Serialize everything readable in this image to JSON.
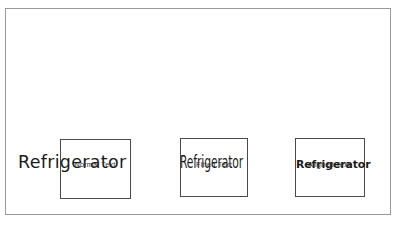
{
  "figure": {
    "background_color": "#ffffff",
    "frame_color": "#9a9a9a",
    "box_border_color": "#4a4a4a",
    "text_color": "#1b1b1b"
  },
  "samples": [
    {
      "id": "normal",
      "text": "Refrigerator",
      "caption": "Normal Text",
      "behavior": "text drawn at natural size, overflowing both edges of the box"
    },
    {
      "id": "fitted",
      "text": "Refrigerator",
      "caption": "Fitted Text",
      "behavior": "text condensed horizontally so its width matches the box width"
    },
    {
      "id": "aligned",
      "text": "Refrigerator",
      "caption": "Aligned Text",
      "behavior": "text scaled down proportionally and aligned inside the box"
    }
  ]
}
